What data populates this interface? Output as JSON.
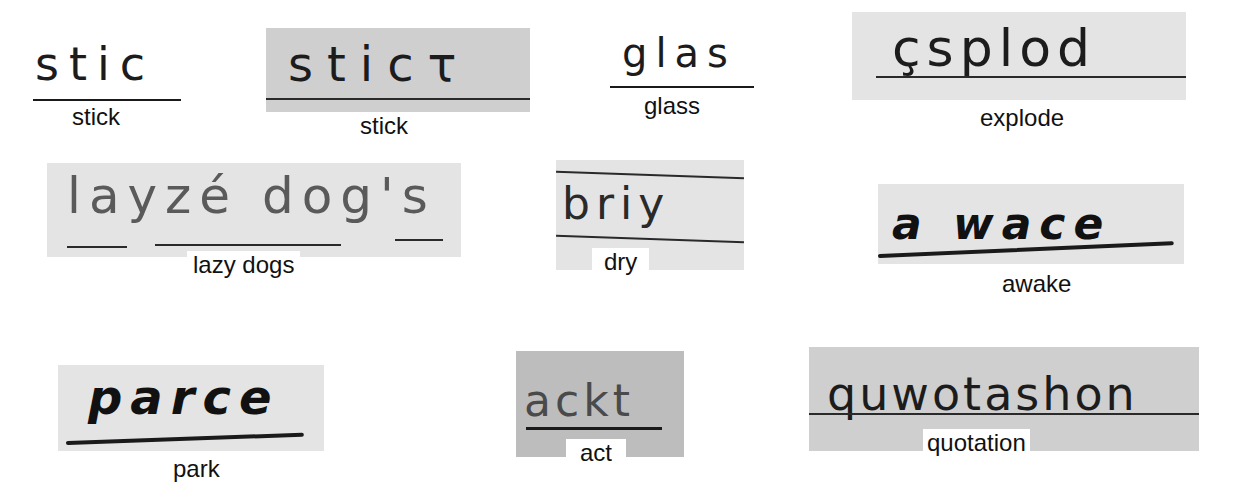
{
  "figure": {
    "samples": [
      {
        "id": "stick-1",
        "written": "stic",
        "correct": "stick"
      },
      {
        "id": "stick-2",
        "written": "sticτ",
        "correct": "stick"
      },
      {
        "id": "glass",
        "written": "glas",
        "correct": "glass"
      },
      {
        "id": "explode",
        "written": "çsplod",
        "correct": "explode"
      },
      {
        "id": "lazy-dogs",
        "written": "layzé dog's",
        "correct": "lazy dogs"
      },
      {
        "id": "dry",
        "written": "briy",
        "correct": "dry"
      },
      {
        "id": "awake",
        "written": "a wace",
        "correct": "awake"
      },
      {
        "id": "park",
        "written": "parce",
        "correct": "park"
      },
      {
        "id": "act",
        "written": "ackt",
        "correct": "act"
      },
      {
        "id": "quotation",
        "written": "quwotashon",
        "correct": "quotation"
      }
    ],
    "colors": {
      "background": "#ffffff",
      "scan_gray": "#d9d9d9",
      "ink": "#1c1c1c",
      "pencil": "#5a5a5a"
    }
  }
}
